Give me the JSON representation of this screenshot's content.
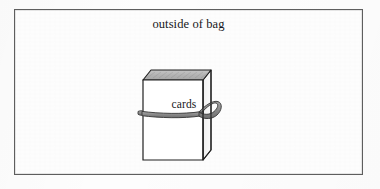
{
  "figure": {
    "kind": "line-drawing",
    "caption_top": "outside of bag",
    "frame": {
      "border_color": "#5e5e5e",
      "background_color": "#fdfdfd"
    },
    "objects": [
      {
        "name": "card-box",
        "label": "cards",
        "description": "open-top rectangular box drawn in three-quarter perspective",
        "face_fill": "#ffffff",
        "top_face_fill": "#b9b9b9",
        "side_face_fill": "#f2f2f2",
        "outline_color": "#1c1c1c"
      },
      {
        "name": "rubber-band",
        "description": "elastic band wrapped horizontally around the box with a loop at the right edge",
        "band_color": "#8a8a8a",
        "band_outline_color": "#3a3a3a"
      }
    ]
  }
}
